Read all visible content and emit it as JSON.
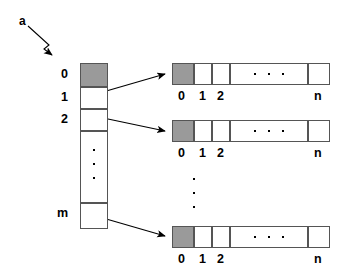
{
  "diagram": {
    "pointer_label": "a",
    "colors": {
      "shaded_cell": "#9a9a9a",
      "cell_border": "#555555",
      "arrow": "#000000",
      "background": "#ffffff"
    },
    "column": {
      "name": "outer-array",
      "labels": [
        "0",
        "1",
        "2",
        "m"
      ],
      "ellipsis": "vertical",
      "shaded_index": 0,
      "cells": [
        {
          "label": "0",
          "shaded": true
        },
        {
          "label": "1",
          "shaded": false
        },
        {
          "label": "2",
          "shaded": false
        },
        {
          "label": "",
          "shaded": false
        },
        {
          "label": "m",
          "shaded": false
        }
      ]
    },
    "rows": [
      {
        "name": "inner-array-0",
        "labels": [
          "0",
          "1",
          "2",
          "n"
        ],
        "ellipsis": "horizontal",
        "shaded_index": 0
      },
      {
        "name": "inner-array-1",
        "labels": [
          "0",
          "1",
          "2",
          "n"
        ],
        "ellipsis": "horizontal",
        "shaded_index": 0
      },
      {
        "name": "inner-array-m",
        "labels": [
          "0",
          "1",
          "2",
          "n"
        ],
        "ellipsis": "horizontal",
        "shaded_index": 0
      }
    ],
    "row_gap_ellipsis": "vertical",
    "arrows": [
      {
        "name": "pointer-arrow-a",
        "from": "a",
        "to": "outer-array"
      },
      {
        "name": "link-arrow-0",
        "from": "outer-cell-1",
        "to": "inner-array-0"
      },
      {
        "name": "link-arrow-1",
        "from": "outer-cell-2",
        "to": "inner-array-1"
      },
      {
        "name": "link-arrow-m",
        "from": "outer-cell-m",
        "to": "inner-array-m"
      }
    ]
  }
}
